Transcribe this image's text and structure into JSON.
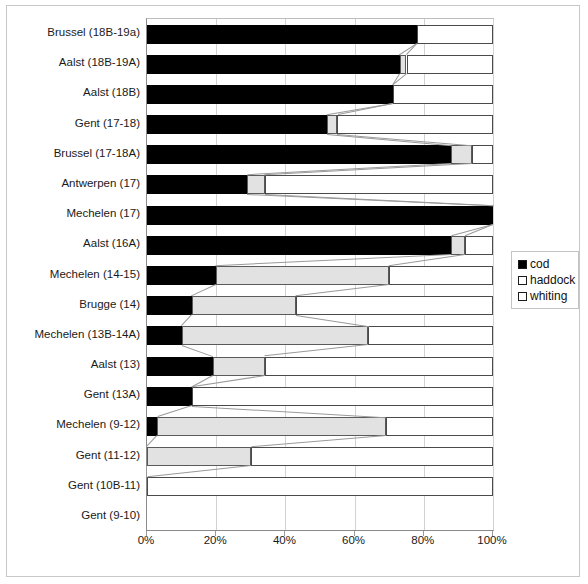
{
  "chart_data": {
    "type": "bar",
    "subtype": "horizontal-stacked-bar",
    "title": "",
    "xlabel": "",
    "ylabel": "",
    "xlim": [
      0,
      100
    ],
    "xticks": [
      "0%",
      "20%",
      "40%",
      "60%",
      "80%",
      "100%"
    ],
    "xtick_values": [
      0,
      20,
      40,
      60,
      80,
      100
    ],
    "grid": true,
    "grid_axis": "x",
    "legend_position": "right",
    "orientation": "horizontal",
    "stacked_total": 100,
    "categories": [
      "Brussel (18B-19a)",
      "Aalst (18B-19A)",
      "Aalst (18B)",
      "Gent (17-18)",
      "Brussel (17-18A)",
      "Antwerpen (17)",
      "Mechelen (17)",
      "Aalst (16A)",
      "Mechelen (14-15)",
      "Brugge (14)",
      "Mechelen (13B-14A)",
      "Aalst (13)",
      "Gent (13A)",
      "Mechelen (9-12)",
      "Gent (11-12)",
      "Gent (10B-11)",
      "Gent (9-10)"
    ],
    "series": [
      {
        "name": "cod",
        "color": "#000000",
        "values": [
          78,
          73,
          71,
          52,
          88,
          29,
          100,
          88,
          20,
          13,
          10,
          19,
          13,
          3,
          0,
          0,
          null
        ]
      },
      {
        "name": "haddock",
        "color": "#e2e2e2",
        "values": [
          0,
          2,
          0,
          3,
          6,
          5,
          0,
          4,
          50,
          30,
          54,
          15,
          0,
          66,
          30,
          0,
          null
        ]
      },
      {
        "name": "whiting",
        "color": "#ffffff",
        "values": [
          22,
          25,
          29,
          45,
          6,
          66,
          0,
          8,
          30,
          57,
          36,
          66,
          87,
          31,
          70,
          100,
          null
        ]
      }
    ]
  },
  "legend": {
    "items": [
      {
        "label": "cod",
        "swatch": "filled-black-square"
      },
      {
        "label": "haddock",
        "swatch": "open-square"
      },
      {
        "label": "whiting",
        "swatch": "open-square"
      }
    ]
  },
  "axis": {
    "x_tick_labels": [
      "0%",
      "20%",
      "40%",
      "60%",
      "80%",
      "100%"
    ]
  }
}
